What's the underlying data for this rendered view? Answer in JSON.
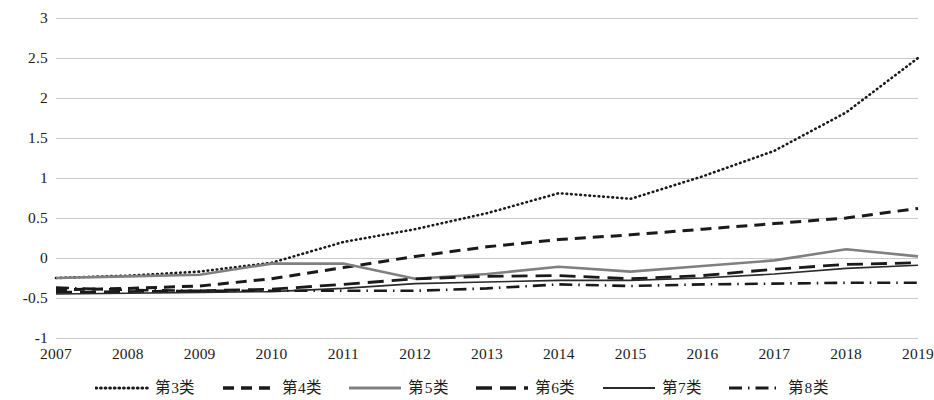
{
  "chart_data": {
    "type": "line",
    "title": "",
    "subtitle": "",
    "xlabel": "",
    "ylabel": "",
    "grid": true,
    "legend_position": "bottom",
    "x": [
      2007,
      2008,
      2009,
      2010,
      2011,
      2012,
      2013,
      2014,
      2015,
      2016,
      2017,
      2018,
      2019
    ],
    "categories": [
      "2007",
      "2008",
      "2009",
      "2010",
      "2011",
      "2012",
      "2013",
      "2014",
      "2015",
      "2016",
      "2017",
      "2018",
      "2019"
    ],
    "xlim": [
      2007,
      2019
    ],
    "ylim": [
      -1,
      3
    ],
    "y_ticks": [
      3,
      2.5,
      2,
      1.5,
      1,
      0.5,
      0,
      -0.5,
      -1
    ],
    "y_tick_labels": [
      "3",
      "2.5",
      "2",
      "1.5",
      "1",
      "0.5",
      "0",
      "-0.5",
      "-1"
    ],
    "x_tick_labels": [
      "2007",
      "2008",
      "2009",
      "2010",
      "2011",
      "2012",
      "2013",
      "2014",
      "2015",
      "2016",
      "2017",
      "2018",
      "2019"
    ],
    "series": [
      {
        "name": "第3类",
        "style": "dotted",
        "color": "#1a1a1a",
        "width": 2.6,
        "dash": "0.6,4.0",
        "values": [
          -0.25,
          -0.22,
          -0.17,
          -0.06,
          0.2,
          0.36,
          0.56,
          0.81,
          0.74,
          1.02,
          1.34,
          1.82,
          2.5
        ]
      },
      {
        "name": "第4类",
        "style": "dashed",
        "color": "#1a1a1a",
        "width": 3.0,
        "dash": "11,7",
        "values": [
          -0.4,
          -0.38,
          -0.35,
          -0.26,
          -0.12,
          0.02,
          0.14,
          0.23,
          0.29,
          0.36,
          0.43,
          0.5,
          0.62
        ]
      },
      {
        "name": "第5类",
        "style": "solid",
        "color": "#808080",
        "width": 2.6,
        "dash": "",
        "values": [
          -0.25,
          -0.23,
          -0.21,
          -0.07,
          -0.07,
          -0.26,
          -0.2,
          -0.11,
          -0.17,
          -0.1,
          -0.03,
          0.11,
          0.02
        ]
      },
      {
        "name": "第6类",
        "style": "long-dash",
        "color": "#1a1a1a",
        "width": 2.8,
        "dash": "16,8",
        "values": [
          -0.43,
          -0.42,
          -0.41,
          -0.39,
          -0.33,
          -0.26,
          -0.23,
          -0.22,
          -0.26,
          -0.22,
          -0.14,
          -0.08,
          -0.06
        ]
      },
      {
        "name": "第7类",
        "style": "thin-solid",
        "color": "#2b2b2b",
        "width": 1.6,
        "dash": "",
        "values": [
          -0.45,
          -0.44,
          -0.43,
          -0.42,
          -0.38,
          -0.32,
          -0.3,
          -0.28,
          -0.28,
          -0.25,
          -0.2,
          -0.13,
          -0.09
        ]
      },
      {
        "name": "第8类",
        "style": "dash-dot",
        "color": "#1a1a1a",
        "width": 2.6,
        "dash": "13,6,1.5,6",
        "values": [
          -0.37,
          -0.4,
          -0.41,
          -0.41,
          -0.41,
          -0.41,
          -0.38,
          -0.33,
          -0.35,
          -0.33,
          -0.32,
          -0.31,
          -0.31
        ]
      }
    ]
  },
  "axes": {
    "y_labels": [
      "3",
      "2.5",
      "2",
      "1.5",
      "1",
      "0.5",
      "0",
      "-0.5",
      "-1"
    ],
    "x_labels": [
      "2007",
      "2008",
      "2009",
      "2010",
      "2011",
      "2012",
      "2013",
      "2014",
      "2015",
      "2016",
      "2017",
      "2018",
      "2019"
    ]
  },
  "legend": {
    "items": [
      {
        "label": "第3类",
        "swatch": "dotted-line-swatch"
      },
      {
        "label": "第4类",
        "swatch": "dashed-line-swatch"
      },
      {
        "label": "第5类",
        "swatch": "solid-gray-line-swatch"
      },
      {
        "label": "第6类",
        "swatch": "long-dash-line-swatch"
      },
      {
        "label": "第7类",
        "swatch": "thin-solid-line-swatch"
      },
      {
        "label": "第8类",
        "swatch": "dash-dot-line-swatch"
      }
    ]
  },
  "colors": {
    "gridline": "#c9c9c9",
    "axis_text": "#1c1c1c",
    "series_dark": "#1a1a1a",
    "series_gray": "#808080",
    "background": "#ffffff"
  }
}
